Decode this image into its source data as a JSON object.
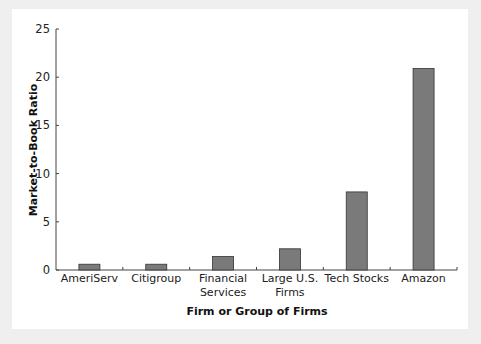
{
  "chart_data": {
    "type": "bar",
    "title": "",
    "xlabel": "Firm or Group of Firms",
    "ylabel": "Market-to-Book Ratio",
    "categories": [
      "AmeriServ",
      "Citigroup",
      "Financial Services",
      "Large U.S. Firms",
      "Tech Stocks",
      "Amazon"
    ],
    "category_lines": [
      [
        "AmeriServ"
      ],
      [
        "Citigroup"
      ],
      [
        "Financial",
        "Services"
      ],
      [
        "Large U.S.",
        "Firms"
      ],
      [
        "Tech Stocks"
      ],
      [
        "Amazon"
      ]
    ],
    "values": [
      0.6,
      0.6,
      1.4,
      2.2,
      8.1,
      20.9
    ],
    "ylim": [
      0,
      25
    ],
    "yticks": [
      0,
      5,
      10,
      15,
      20,
      25
    ],
    "grid": false,
    "legend": null,
    "bar_color": "#7a7a7a",
    "bar_edge_color": "#333333"
  }
}
